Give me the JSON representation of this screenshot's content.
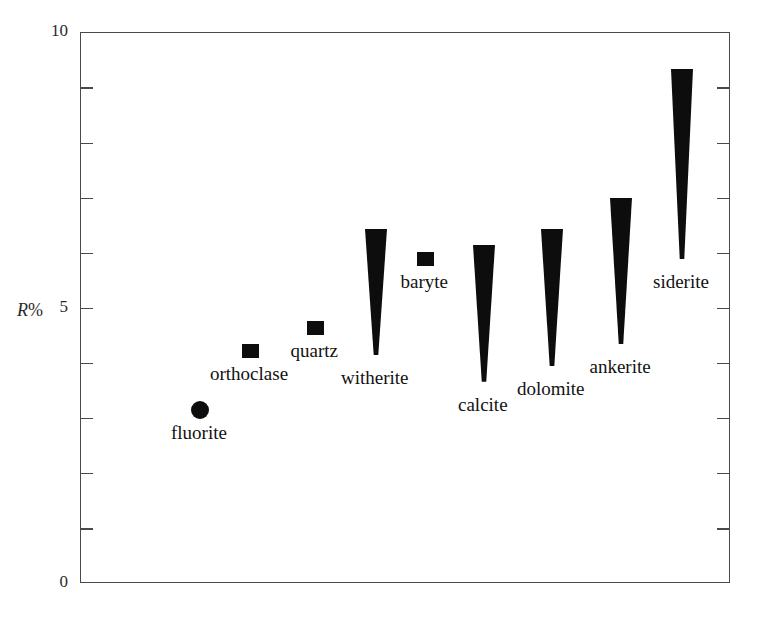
{
  "chart_data": {
    "type": "scatter",
    "title": "",
    "xlabel": "",
    "ylabel": "R%",
    "ylim": [
      0,
      10
    ],
    "yticks": [
      0,
      1,
      2,
      3,
      4,
      5,
      6,
      7,
      8,
      9,
      10
    ],
    "ytick_labels": {
      "0": "0",
      "5": "5",
      "10": "10"
    },
    "grid": false,
    "legend": false,
    "xaxis_visible": false,
    "points": [
      {
        "name": "fluorite",
        "marker": "circle",
        "value": 3.15,
        "x_index": 1,
        "x_px": 199,
        "label_position": "below"
      },
      {
        "name": "orthoclase",
        "marker": "square",
        "value": 4.23,
        "x_index": 2,
        "x_px": 249,
        "label_position": "below"
      },
      {
        "name": "quartz",
        "marker": "square",
        "value": 4.65,
        "x_index": 3,
        "x_px": 314,
        "label_position": "below"
      },
      {
        "name": "witherite",
        "marker": "wedge",
        "value_max": 6.45,
        "value_min": 4.15,
        "x_index": 4,
        "x_px": 375,
        "label_position": "below"
      },
      {
        "name": "baryte",
        "marker": "square",
        "value": 5.9,
        "x_index": 5,
        "x_px": 424,
        "label_position": "below"
      },
      {
        "name": "calcite",
        "marker": "wedge",
        "value_max": 6.15,
        "value_min": 3.67,
        "x_index": 6,
        "x_px": 483,
        "label_position": "below"
      },
      {
        "name": "dolomite",
        "marker": "wedge",
        "value_max": 6.45,
        "value_min": 3.95,
        "x_index": 7,
        "x_px": 551,
        "label_position": "below"
      },
      {
        "name": "ankerite",
        "marker": "wedge",
        "value_max": 7.0,
        "value_min": 4.35,
        "x_index": 8,
        "x_px": 620,
        "label_position": "below"
      },
      {
        "name": "siderite",
        "marker": "wedge",
        "value_max": 9.35,
        "value_min": 5.9,
        "x_index": 9,
        "x_px": 681,
        "label_position": "below"
      }
    ],
    "labels": {
      "fluorite": "fluorite",
      "orthoclase": "orthoclase",
      "quartz": "quartz",
      "witherite": "witherite",
      "baryte": "baryte",
      "calcite": "calcite",
      "dolomite": "dolomite",
      "ankerite": "ankerite",
      "siderite": "siderite"
    },
    "axis": {
      "label_r": "R",
      "label_percent": "%",
      "top_label": "10",
      "mid_label": "5",
      "bottom_label": "0"
    },
    "colors": {
      "marker": "#0d0d0d",
      "axis": "#4a4a4a",
      "text": "#121212",
      "background": "#ffffff"
    }
  }
}
